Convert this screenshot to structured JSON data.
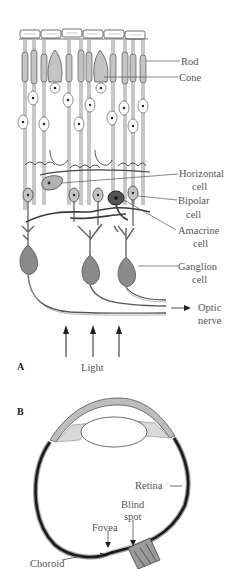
{
  "figure": {
    "panel_a": {
      "letter": "A",
      "labels": {
        "rod": "Rod",
        "cone": "Cone",
        "horizontal_1": "Horizontal",
        "horizontal_2": "cell",
        "bipolar_1": "Bipolar",
        "bipolar_2": "cell",
        "amacrine_1": "Amacrine",
        "amacrine_2": "cell",
        "ganglion_1": "Ganglion",
        "ganglion_2": "cell",
        "optic_1": "Optic",
        "optic_2": "nerve",
        "light": "Light"
      }
    },
    "panel_b": {
      "letter": "B",
      "labels": {
        "retina": "Retina",
        "blind_1": "Blind",
        "blind_2": "spot",
        "fovea": "Fovea",
        "choroid": "Choroid"
      }
    },
    "colors": {
      "ink": "#333333",
      "cell_fill": "#8a8a8a",
      "cell_light": "#cfcfcf",
      "label": "#555555"
    }
  }
}
